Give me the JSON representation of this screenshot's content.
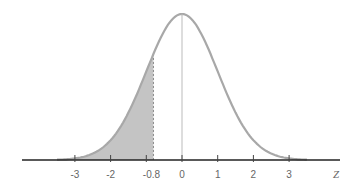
{
  "chart_data": {
    "type": "area",
    "title": "",
    "xlabel": "Z",
    "ylabel": "",
    "xlim": [
      -3.5,
      3.5
    ],
    "ticks": [
      {
        "value": -3,
        "label": "-3"
      },
      {
        "value": -2,
        "label": "-2"
      },
      {
        "value": -0.8,
        "label": "-0.8"
      },
      {
        "value": 0,
        "label": "0"
      },
      {
        "value": 1,
        "label": "1"
      },
      {
        "value": 2,
        "label": "2"
      },
      {
        "value": 3,
        "label": "3"
      }
    ],
    "series": [
      {
        "name": "standard normal density",
        "mean": 0,
        "sd": 1
      }
    ],
    "shaded_region": {
      "from": -3.5,
      "to": -0.8,
      "color": "#c4c4c4"
    },
    "center_line": 0,
    "grid": false,
    "legend": null,
    "colors": {
      "curve": "#a8a8a8",
      "axis": "#222222",
      "fill": "#c4c4c4",
      "text": "#666666"
    }
  }
}
